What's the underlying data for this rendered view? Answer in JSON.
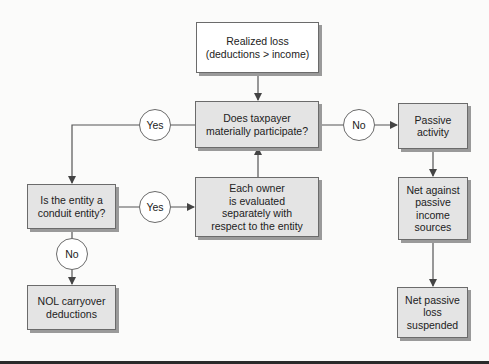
{
  "diagram": {
    "nodes": {
      "realized_loss": {
        "line1": "Realized loss",
        "line2": "(deductions > income)"
      },
      "material_participation": {
        "line1": "Does taxpayer",
        "line2": "materially participate?"
      },
      "conduit_entity": {
        "line1": "Is the entity a",
        "line2": "conduit entity?"
      },
      "each_owner": {
        "line1": "Each owner",
        "line2": "is evaluated",
        "line3": "separately with",
        "line4": "respect to the entity"
      },
      "passive_activity": {
        "line1": "Passive",
        "line2": "activity"
      },
      "net_against": {
        "line1": "Net against",
        "line2": "passive",
        "line3": "income",
        "line4": "sources"
      },
      "net_passive_loss": {
        "line1": "Net passive",
        "line2": "loss",
        "line3": "suspended"
      },
      "nol_carryover": {
        "line1": "NOL carryover",
        "line2": "deductions"
      }
    },
    "decisions": {
      "participate_yes": "Yes",
      "participate_no": "No",
      "conduit_yes": "Yes",
      "conduit_no": "No"
    },
    "colors": {
      "decision_fill": "#e4e4e4",
      "start_fill": "#ffffff",
      "line": "#555555"
    }
  }
}
